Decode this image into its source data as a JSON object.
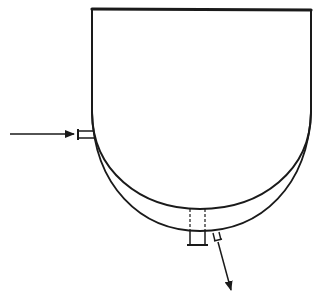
{
  "diagram": {
    "type": "jacketed-vessel",
    "description": "Open-top vessel with hemispherical bottom surrounded by a jacket; inlet nozzle on left jacket, outlet nozzle on bottom of jacket",
    "colors": {
      "background": "#ffffff",
      "line": "#1a1a1a"
    },
    "vessel": {
      "top_edge": {
        "x1": 92,
        "y1": 9,
        "x2": 311,
        "y2": 10
      },
      "left_wall_x": 92,
      "right_wall_x": 311,
      "straight_wall_bottom_y": 112,
      "inner_bottom_y": 209,
      "outer_bottom_y": 231
    },
    "inlet": {
      "label": "",
      "arrow": {
        "x1": 10,
        "y1": 134,
        "x2": 74,
        "y2": 134
      },
      "nozzle": {
        "x1": 78,
        "x2": 92,
        "y_top": 131,
        "y_bottom": 138
      }
    },
    "bottom_nozzle": {
      "x_left": 190,
      "x_right": 205,
      "y_top": 209,
      "y_bottom": 245,
      "flange_x1": 187,
      "flange_x2": 208
    },
    "outlet": {
      "label": "",
      "nozzle": {
        "x": 213,
        "y": 233,
        "w": 7,
        "h": 7
      },
      "arrow": {
        "x1": 217,
        "y1": 241,
        "x2": 232,
        "y2": 292
      }
    }
  }
}
